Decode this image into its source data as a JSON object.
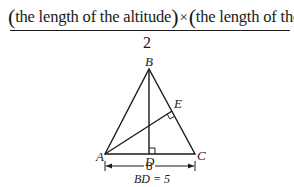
{
  "formula": {
    "numerator_left": "the length of the altitude",
    "times": "×",
    "numerator_right": "the length of the base",
    "denominator": "2",
    "paren_open": "(",
    "paren_close": ")"
  },
  "diagram": {
    "vertices": {
      "A": {
        "label": "A"
      },
      "B": {
        "label": "B"
      },
      "C": {
        "label": "C"
      },
      "D": {
        "label": "D"
      },
      "E": {
        "label": "E"
      }
    },
    "base_length_label": "8",
    "given": "BD = 5",
    "colors": {
      "line": "#1a1a1a",
      "background": "#ffffff"
    }
  }
}
